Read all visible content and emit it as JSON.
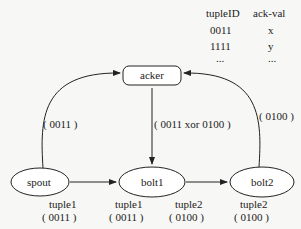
{
  "table": {
    "headers": [
      "tupleID",
      "ack-val"
    ],
    "rows": [
      [
        "0011",
        "x"
      ],
      [
        "1111",
        "y"
      ],
      [
        "...",
        "..."
      ]
    ]
  },
  "nodes": {
    "acker": "acker",
    "spout": "spout",
    "bolt1": "bolt1",
    "bolt2": "bolt2"
  },
  "edge_labels": {
    "spout_to_acker": "( 0011 )",
    "acker_to_bolt1": "( 0011 xor 0100 )",
    "bolt2_to_acker": "( 0100 )"
  },
  "tuple_labels": [
    {
      "name": "tuple1",
      "id": "( 0011 )"
    },
    {
      "name": "tuple1",
      "id": "( 0011 )"
    },
    {
      "name": "tuple2",
      "id": "( 0100 )"
    },
    {
      "name": "tuple2",
      "id": "( 0100 )"
    }
  ]
}
